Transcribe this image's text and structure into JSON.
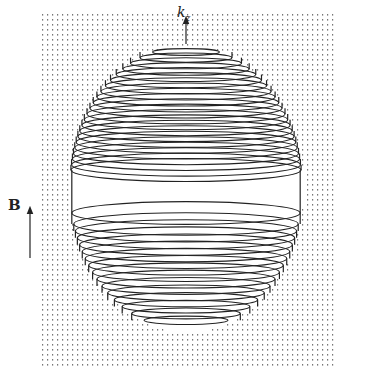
{
  "figure": {
    "labels": {
      "kz_main": "k",
      "kz_sub": "z",
      "field": "B"
    },
    "colors": {
      "background": "#ffffff",
      "lines": "#222222",
      "dots": "#777777"
    },
    "sphere": {
      "cx": 186,
      "cy": 188,
      "rx": 116,
      "ry": 142,
      "equatorial_band": {
        "top": 170,
        "bottom": 213
      }
    },
    "dot_field": {
      "x0": 42,
      "x1": 332,
      "y0": 14,
      "y1": 365,
      "spacing": 5
    },
    "axis_arrow_kz": {
      "x": 186,
      "y_from": 44,
      "y_to": 20
    },
    "field_arrow_B": {
      "x": 30,
      "y_from": 258,
      "y_to": 210
    }
  }
}
